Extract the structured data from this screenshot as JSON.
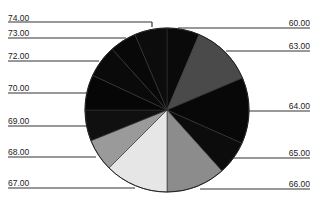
{
  "chart_data": {
    "type": "pie",
    "title": "",
    "start_angle_deg": 0,
    "direction": "clockwise",
    "center": [
      167,
      110
    ],
    "radius": 82,
    "slices": [
      {
        "label": "60.00",
        "start": 0,
        "end": 23,
        "color": "#0a0a0a"
      },
      {
        "label": "63.00",
        "start": 23,
        "end": 67,
        "color": "#4a4a4a"
      },
      {
        "label": "64.00",
        "start": 67,
        "end": 114,
        "color": "#080808"
      },
      {
        "label": "65.00",
        "start": 114,
        "end": 138,
        "color": "#0c0c0c"
      },
      {
        "label": "66.00",
        "start": 138,
        "end": 180,
        "color": "#8c8c8c"
      },
      {
        "label": "67.00",
        "start": 180,
        "end": 225,
        "color": "#e6e6e6"
      },
      {
        "label": "68.00",
        "start": 225,
        "end": 248,
        "color": "#9a9a9a"
      },
      {
        "label": "69.00",
        "start": 248,
        "end": 270,
        "color": "#101010"
      },
      {
        "label": "70.00",
        "start": 270,
        "end": 295,
        "color": "#060606"
      },
      {
        "label": "72.00",
        "start": 295,
        "end": 318,
        "color": "#0a0a0a"
      },
      {
        "label": "73.00",
        "start": 318,
        "end": 337,
        "color": "#080808"
      },
      {
        "label": "74.00",
        "start": 337,
        "end": 360,
        "color": "#0c0c0c"
      }
    ],
    "labels_left": [
      {
        "text": "74.00",
        "x": 8,
        "y": 13,
        "line_y": 22,
        "line_end": [
          152,
          22
        ],
        "elbow": [
          152,
          27
        ]
      },
      {
        "text": "73.00",
        "x": 8,
        "y": 28,
        "line_y": 38,
        "line_end": [
          126,
          38
        ]
      },
      {
        "text": "72.00",
        "x": 8,
        "y": 51,
        "line_y": 61,
        "line_end": [
          99,
          61
        ]
      },
      {
        "text": "70.00",
        "x": 8,
        "y": 83,
        "line_y": 93,
        "line_end": [
          88,
          93
        ]
      },
      {
        "text": "69.00",
        "x": 8,
        "y": 116,
        "line_y": 126,
        "line_end": [
          87,
          126
        ]
      },
      {
        "text": "68.00",
        "x": 8,
        "y": 147,
        "line_y": 157,
        "line_end": [
          96,
          157
        ]
      },
      {
        "text": "67.00",
        "x": 8,
        "y": 178,
        "line_y": 188,
        "line_end": [
          135,
          188
        ]
      }
    ],
    "labels_right": [
      {
        "text": "60.00",
        "x": 260,
        "y": 18,
        "line_y": 28,
        "line_start": [
          178,
          28
        ]
      },
      {
        "text": "63.00",
        "x": 260,
        "y": 41,
        "line_y": 51,
        "line_start": [
          226,
          51
        ]
      },
      {
        "text": "64.00",
        "x": 260,
        "y": 101,
        "line_y": 111,
        "line_start": [
          248,
          111
        ]
      },
      {
        "text": "65.00",
        "x": 260,
        "y": 148,
        "line_y": 158,
        "line_start": [
          233,
          158
        ]
      },
      {
        "text": "66.00",
        "x": 260,
        "y": 179,
        "line_y": 189,
        "line_start": [
          200,
          189
        ]
      }
    ],
    "legend": "none",
    "grid": false
  }
}
